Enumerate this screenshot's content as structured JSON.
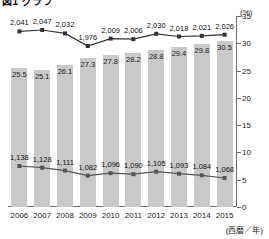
{
  "chart_data": {
    "type": "bar",
    "title": "図1 グラフ",
    "categories": [
      "2006",
      "2007",
      "2008",
      "2009",
      "2010",
      "2011",
      "2012",
      "2013",
      "2014",
      "2015"
    ],
    "xlabel": "(西暦／年)",
    "ylabel": "(%)",
    "ylim": [
      0,
      35
    ],
    "yticks": [
      "0",
      "5",
      "10",
      "15",
      "20",
      "25",
      "30",
      "35"
    ],
    "grid": false,
    "legend_position": "none",
    "series": [
      {
        "name": "割合",
        "type": "bar",
        "unit": "%",
        "axis": "right",
        "color": "#c9c9c9",
        "values": [
          25.5,
          25.1,
          26.1,
          27.3,
          27.8,
          28.2,
          28.8,
          29.4,
          29.8,
          30.5
        ],
        "labels": [
          "25.5",
          "25.1",
          "26.1",
          "27.3",
          "27.8",
          "28.2",
          "28.8",
          "29.4",
          "29.8",
          "30.5"
        ]
      },
      {
        "name": "上段系列",
        "type": "line",
        "color": "#333333",
        "values": [
          2041,
          2047,
          2032,
          1976,
          2009,
          2006,
          2030,
          2018,
          2021,
          2026
        ],
        "labels": [
          "2,041",
          "2,047",
          "2,032",
          "1,976",
          "2,009",
          "2,006",
          "2,030",
          "2,018",
          "2,021",
          "2,026"
        ]
      },
      {
        "name": "下段系列",
        "type": "line",
        "color": "#555555",
        "values": [
          1138,
          1128,
          1111,
          1082,
          1096,
          1090,
          1105,
          1093,
          1084,
          1068
        ],
        "labels": [
          "1,138",
          "1,128",
          "1,111",
          "1,082",
          "1,096",
          "1,090",
          "1,105",
          "1,093",
          "1,084",
          "1,068"
        ]
      }
    ]
  }
}
